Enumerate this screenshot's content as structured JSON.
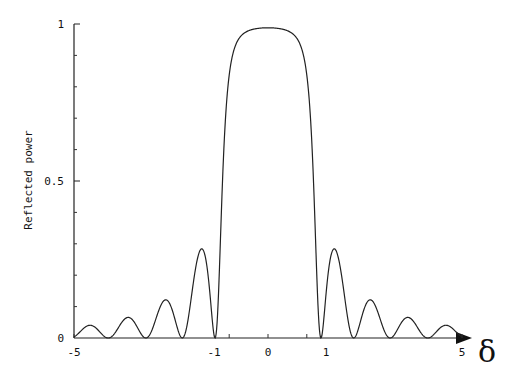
{
  "chart_data": {
    "type": "line",
    "title": "",
    "xlabel": "δ",
    "ylabel": "Reflected power",
    "xlim": [
      -5,
      5
    ],
    "ylim": [
      0,
      1
    ],
    "grid": false,
    "legend": null,
    "x_ticks": [
      -5,
      -1,
      0,
      1,
      5
    ],
    "x_tick_labels": [
      "-5",
      "-1",
      "0",
      "1",
      "5"
    ],
    "y_ticks": [
      0,
      0.5,
      1
    ],
    "y_tick_labels": [
      "0",
      "0.5",
      "1"
    ],
    "series": [
      {
        "name": "Reflected power",
        "description": "Bragg-grating reflection spectrum: flat-topped main lobe near 1 between δ=-1 and δ=1, with decaying symmetric sidelobes",
        "x": [
          -5,
          -4.5,
          -4.0,
          -3.6,
          -3.2,
          -2.8,
          -2.2,
          -1.7,
          -1.3,
          -1.0,
          -0.9,
          -0.7,
          -0.5,
          0,
          0.5,
          0.7,
          0.9,
          1.0,
          1.3,
          1.7,
          2.2,
          2.8,
          3.2,
          3.6,
          4.0,
          4.5,
          5
        ],
        "values": [
          0.03,
          0.04,
          0.0,
          0.0,
          0.07,
          0.0,
          0.13,
          0.0,
          0.3,
          0.0,
          0.45,
          0.9,
          0.98,
          0.99,
          0.98,
          0.9,
          0.45,
          0.0,
          0.3,
          0.0,
          0.13,
          0.0,
          0.07,
          0.0,
          0.0,
          0.04,
          0.03
        ]
      }
    ],
    "peak_value": 0.99,
    "sidelobe_peaks": [
      {
        "x": 1.3,
        "y": 0.3
      },
      {
        "x": 2.2,
        "y": 0.13
      },
      {
        "x": 3.2,
        "y": 0.07
      },
      {
        "x": 4.5,
        "y": 0.04
      }
    ]
  },
  "axis": {
    "ylabel": "Reflected power",
    "xlabel": "δ"
  }
}
